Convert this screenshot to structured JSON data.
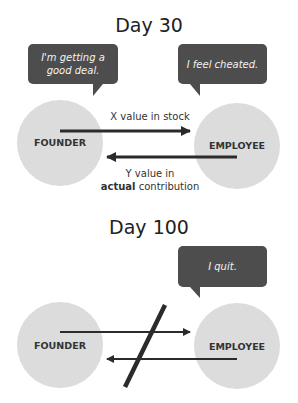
{
  "panels": [
    {
      "title": "Day 30",
      "founder_label": "FOUNDER",
      "employee_label": "EMPLOYEE",
      "founder_bubble": "I'm getting a good deal.",
      "employee_bubble": "I feel cheated.",
      "top_arrow_caption": "X value in stock",
      "bottom_arrow_caption_line1": "Y value in",
      "bottom_arrow_caption_bold": "actual",
      "bottom_arrow_caption_rest": "contribution"
    },
    {
      "title": "Day 100",
      "founder_label": "FOUNDER",
      "employee_label": "EMPLOYEE",
      "employee_bubble": "I quit.",
      "exchange_broken": true
    }
  ],
  "colors": {
    "bubble": "#4d4d4d",
    "circle": "#dcdcdc",
    "arrow": "#2b2b2b"
  }
}
